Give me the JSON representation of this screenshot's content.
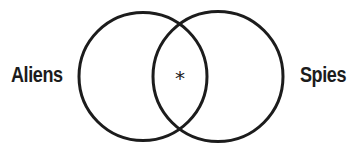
{
  "diagram": {
    "type": "venn",
    "sets": [
      {
        "id": "left",
        "label": "Aliens"
      },
      {
        "id": "right",
        "label": "Spies"
      }
    ],
    "intersection": {
      "marker": "*",
      "marker_name": "asterisk"
    },
    "colors": {
      "stroke": "#1c1c1c",
      "text": "#1c1c1c",
      "background": "#ffffff"
    }
  }
}
